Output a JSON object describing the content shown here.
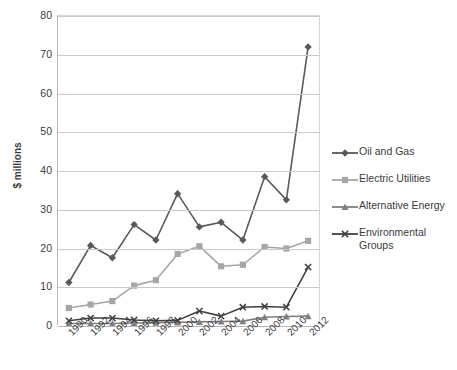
{
  "chart_data": {
    "type": "line",
    "title": "",
    "xlabel": "",
    "ylabel": "$ millions",
    "ylim": [
      0,
      80
    ],
    "ytick_step": 10,
    "grid": true,
    "legend_position": "right",
    "categories": [
      "1990",
      "1992",
      "1994",
      "1996",
      "1998",
      "2000",
      "2002",
      "2004",
      "2006",
      "2008",
      "2010",
      "2012"
    ],
    "yticks": [
      "0",
      "10",
      "20",
      "30",
      "40",
      "50",
      "60",
      "70",
      "80"
    ],
    "series": [
      {
        "name": "Oil and Gas",
        "color": "#595959",
        "marker": "diamond",
        "values": [
          11,
          20.6,
          17.4,
          26,
          22,
          34,
          25.4,
          26.6,
          22,
          38.4,
          32.4,
          72
        ]
      },
      {
        "name": "Electric Utilities",
        "color": "#a6a6a6",
        "marker": "square",
        "values": [
          4.4,
          5.3,
          6.2,
          10.2,
          11.6,
          18.4,
          20.4,
          15.2,
          15.6,
          20.2,
          19.8,
          21.8
        ]
      },
      {
        "name": "Alternative Energy",
        "color": "#7f7f7f",
        "marker": "triangle",
        "values": [
          0.4,
          0.4,
          0.4,
          0.5,
          0.6,
          0.7,
          0.8,
          0.9,
          1.0,
          2.0,
          2.2,
          2.3
        ]
      },
      {
        "name": "Environmental Groups",
        "color": "#404040",
        "marker": "cross",
        "values": [
          1.1,
          1.8,
          1.8,
          1.3,
          1.1,
          1.2,
          3.6,
          2.3,
          4.6,
          4.8,
          4.6,
          15.0
        ]
      }
    ]
  },
  "legend": {
    "items": [
      {
        "label": "Oil and Gas"
      },
      {
        "label": "Electric Utilities"
      },
      {
        "label": "Alternative Energy"
      },
      {
        "label": "Environmental Groups"
      }
    ]
  }
}
